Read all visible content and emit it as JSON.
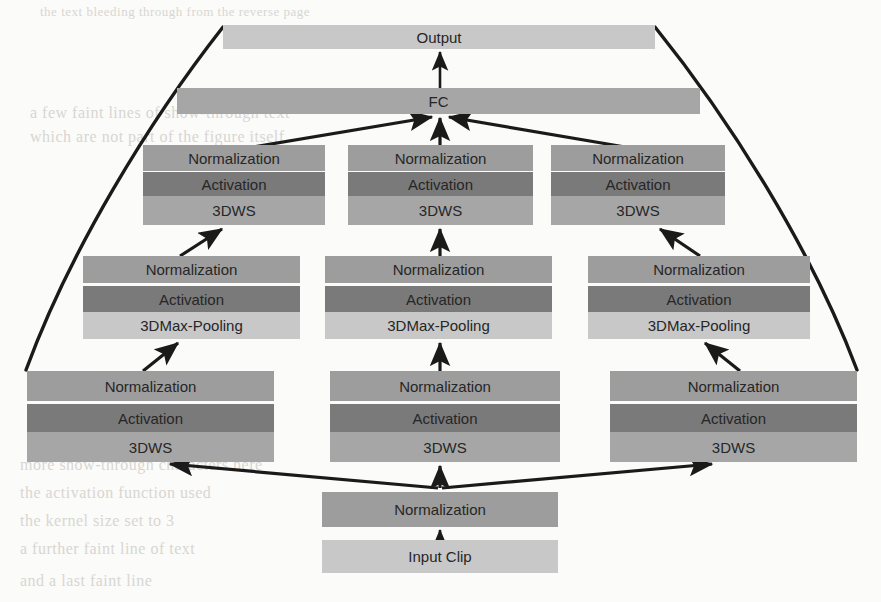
{
  "diagram": {
    "palette": {
      "light": "#c8c8c8",
      "mid": "#a6a6a6",
      "dark": "#7a7a7a",
      "normalization": "#9d9d9d",
      "line": "#1a1a1a",
      "background": "#fbfbf9"
    },
    "labels": {
      "output": "Output",
      "fc": "FC",
      "normalization": "Normalization",
      "activation": "Activation",
      "dws": "3DWS",
      "maxpool": "3DMax-Pooling",
      "input_clip": "Input Clip"
    },
    "blocks": [
      {
        "id": "output",
        "label_key": "output",
        "x": 223,
        "y": 25,
        "w": 432,
        "h": 24,
        "tone": "light"
      },
      {
        "id": "fc",
        "label_key": "fc",
        "x": 177,
        "y": 88,
        "w": 523,
        "h": 26,
        "tone": "mid"
      },
      {
        "id": "t1-norm",
        "label_key": "normalization",
        "x": 143,
        "y": 145,
        "w": 182,
        "h": 26,
        "tone": "norm"
      },
      {
        "id": "t1-act",
        "label_key": "activation",
        "x": 143,
        "y": 172,
        "w": 182,
        "h": 24,
        "tone": "dark"
      },
      {
        "id": "t1-dws",
        "label_key": "dws",
        "x": 143,
        "y": 196,
        "w": 182,
        "h": 29,
        "tone": "mid"
      },
      {
        "id": "t2-norm",
        "label_key": "normalization",
        "x": 348,
        "y": 145,
        "w": 185,
        "h": 26,
        "tone": "norm"
      },
      {
        "id": "t2-act",
        "label_key": "activation",
        "x": 348,
        "y": 172,
        "w": 185,
        "h": 24,
        "tone": "dark"
      },
      {
        "id": "t2-dws",
        "label_key": "dws",
        "x": 348,
        "y": 196,
        "w": 185,
        "h": 29,
        "tone": "mid"
      },
      {
        "id": "t3-norm",
        "label_key": "normalization",
        "x": 551,
        "y": 145,
        "w": 174,
        "h": 26,
        "tone": "norm"
      },
      {
        "id": "t3-act",
        "label_key": "activation",
        "x": 551,
        "y": 172,
        "w": 174,
        "h": 24,
        "tone": "dark"
      },
      {
        "id": "t3-dws",
        "label_key": "dws",
        "x": 551,
        "y": 196,
        "w": 174,
        "h": 29,
        "tone": "mid"
      },
      {
        "id": "m1-norm",
        "label_key": "normalization",
        "x": 83,
        "y": 256,
        "w": 217,
        "h": 27,
        "tone": "norm"
      },
      {
        "id": "m1-act",
        "label_key": "activation",
        "x": 83,
        "y": 286,
        "w": 217,
        "h": 26,
        "tone": "dark"
      },
      {
        "id": "m1-pool",
        "label_key": "maxpool",
        "x": 83,
        "y": 312,
        "w": 217,
        "h": 27,
        "tone": "light"
      },
      {
        "id": "m2-norm",
        "label_key": "normalization",
        "x": 325,
        "y": 256,
        "w": 227,
        "h": 27,
        "tone": "norm"
      },
      {
        "id": "m2-act",
        "label_key": "activation",
        "x": 325,
        "y": 286,
        "w": 227,
        "h": 26,
        "tone": "dark"
      },
      {
        "id": "m2-pool",
        "label_key": "maxpool",
        "x": 325,
        "y": 312,
        "w": 227,
        "h": 27,
        "tone": "light"
      },
      {
        "id": "m3-norm",
        "label_key": "normalization",
        "x": 588,
        "y": 256,
        "w": 222,
        "h": 27,
        "tone": "norm"
      },
      {
        "id": "m3-act",
        "label_key": "activation",
        "x": 588,
        "y": 286,
        "w": 222,
        "h": 26,
        "tone": "dark"
      },
      {
        "id": "m3-pool",
        "label_key": "maxpool",
        "x": 588,
        "y": 312,
        "w": 222,
        "h": 27,
        "tone": "light"
      },
      {
        "id": "b1-norm",
        "label_key": "normalization",
        "x": 27,
        "y": 371,
        "w": 247,
        "h": 30,
        "tone": "norm"
      },
      {
        "id": "b1-act",
        "label_key": "activation",
        "x": 27,
        "y": 404,
        "w": 247,
        "h": 28,
        "tone": "dark"
      },
      {
        "id": "b1-dws",
        "label_key": "dws",
        "x": 27,
        "y": 432,
        "w": 247,
        "h": 30,
        "tone": "mid"
      },
      {
        "id": "b2-norm",
        "label_key": "normalization",
        "x": 330,
        "y": 371,
        "w": 230,
        "h": 30,
        "tone": "norm"
      },
      {
        "id": "b2-act",
        "label_key": "activation",
        "x": 330,
        "y": 404,
        "w": 230,
        "h": 28,
        "tone": "dark"
      },
      {
        "id": "b2-dws",
        "label_key": "dws",
        "x": 330,
        "y": 432,
        "w": 230,
        "h": 30,
        "tone": "mid"
      },
      {
        "id": "b3-norm",
        "label_key": "normalization",
        "x": 610,
        "y": 371,
        "w": 247,
        "h": 30,
        "tone": "norm"
      },
      {
        "id": "b3-act",
        "label_key": "activation",
        "x": 610,
        "y": 404,
        "w": 247,
        "h": 28,
        "tone": "dark"
      },
      {
        "id": "b3-dws",
        "label_key": "dws",
        "x": 610,
        "y": 432,
        "w": 247,
        "h": 30,
        "tone": "mid"
      },
      {
        "id": "in-norm",
        "label_key": "normalization",
        "x": 322,
        "y": 492,
        "w": 236,
        "h": 35,
        "tone": "norm"
      },
      {
        "id": "input-clip",
        "label_key": "input_clip",
        "x": 322,
        "y": 540,
        "w": 236,
        "h": 33,
        "tone": "light"
      }
    ],
    "connections": [
      {
        "from": "fc",
        "to": "output",
        "kind": "arrow"
      },
      {
        "from": "t1-norm",
        "to": "fc",
        "kind": "arrow"
      },
      {
        "from": "t2-norm",
        "to": "fc",
        "kind": "arrow"
      },
      {
        "from": "t3-norm",
        "to": "fc",
        "kind": "arrow"
      },
      {
        "from": "m1-norm",
        "to": "t1-dws",
        "kind": "arrow"
      },
      {
        "from": "m2-norm",
        "to": "t2-dws",
        "kind": "arrow"
      },
      {
        "from": "m3-norm",
        "to": "t3-dws",
        "kind": "arrow"
      },
      {
        "from": "b1-norm",
        "to": "m1-pool",
        "kind": "arrow"
      },
      {
        "from": "b2-norm",
        "to": "m2-pool",
        "kind": "arrow"
      },
      {
        "from": "b3-norm",
        "to": "m3-pool",
        "kind": "arrow"
      },
      {
        "from": "in-norm",
        "to": "b1-dws",
        "kind": "arrow"
      },
      {
        "from": "in-norm",
        "to": "b2-dws",
        "kind": "arrow"
      },
      {
        "from": "in-norm",
        "to": "b3-dws",
        "kind": "arrow"
      },
      {
        "from": "input-clip",
        "to": "in-norm",
        "kind": "arrow"
      },
      {
        "from": "output",
        "to": "b1-norm",
        "kind": "skip-curve-left"
      },
      {
        "from": "output",
        "to": "b3-norm",
        "kind": "skip-curve-right"
      }
    ]
  },
  "artifacts": [
    {
      "text": "the text bleeding through from the reverse page",
      "x": 40,
      "y": 4,
      "size": 13
    },
    {
      "text": "a few faint lines of show-through text",
      "x": 30,
      "y": 104,
      "size": 16
    },
    {
      "text": "which are not part of the figure itself",
      "x": 30,
      "y": 128,
      "size": 16
    },
    {
      "text": "more show-through characters here",
      "x": 20,
      "y": 456,
      "size": 16
    },
    {
      "text": "the activation function used",
      "x": 20,
      "y": 484,
      "size": 16
    },
    {
      "text": "the kernel size set to 3",
      "x": 20,
      "y": 512,
      "size": 16
    },
    {
      "text": "a further faint line of text",
      "x": 20,
      "y": 540,
      "size": 16
    },
    {
      "text": "and a last faint line",
      "x": 20,
      "y": 572,
      "size": 16
    }
  ]
}
